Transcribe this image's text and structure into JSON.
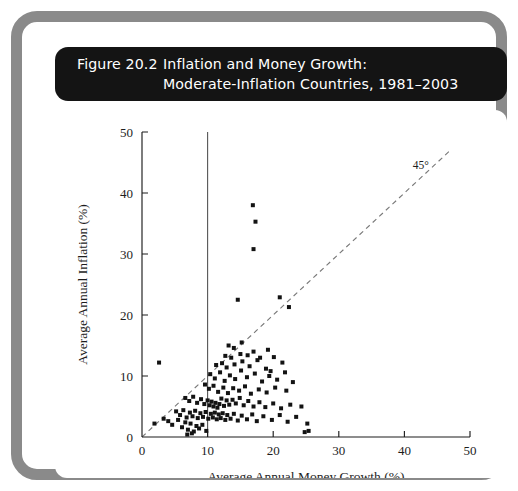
{
  "figure": {
    "number_label": "Figure 20.2",
    "title_line1": "Inflation and Money Growth:",
    "title_line2": "Moderate-Inflation Countries, 1981–2003",
    "frame_color": "#8a8a8a",
    "titlebar_color": "#141414",
    "panel_color": "#ffffff"
  },
  "chart_data": {
    "type": "scatter",
    "title": "Inflation and Money Growth: Moderate-Inflation Countries, 1981–2003",
    "xlabel": "Average Annual Money Growth (%)",
    "ylabel": "Average Annual Inflation (%)",
    "xlim": [
      0,
      50
    ],
    "ylim": [
      0,
      50
    ],
    "xticks": [
      0,
      10,
      20,
      30,
      40,
      50
    ],
    "yticks": [
      0,
      10,
      20,
      30,
      40,
      50
    ],
    "xticklabels": [
      "0",
      "10",
      "20",
      "30",
      "40",
      "50"
    ],
    "yticklabels": [
      "0",
      "10",
      "20",
      "30",
      "40",
      "50"
    ],
    "grid": false,
    "legend": null,
    "marker": "square",
    "marker_color": "#131313",
    "annotations": [
      {
        "text": "45°",
        "x": 42.5,
        "y": 44.0,
        "name": "forty-five-degree-label"
      }
    ],
    "reference_lines": [
      {
        "name": "forty-five-degree-line",
        "type": "diagonal",
        "from": [
          0,
          0
        ],
        "to": [
          47,
          47
        ],
        "style": "dashed",
        "color": "#7a7a7a"
      },
      {
        "name": "money-growth-10-percent-line",
        "type": "vertical",
        "x": 10,
        "y_from": 0,
        "y_to": 50,
        "style": "solid",
        "color": "#555555"
      }
    ],
    "series": [
      {
        "name": "Moderate-inflation countries",
        "points": [
          [
            2.6,
            12.2
          ],
          [
            16.9,
            38.0
          ],
          [
            17.3,
            35.3
          ],
          [
            17.0,
            30.8
          ],
          [
            14.6,
            22.5
          ],
          [
            21.0,
            22.9
          ],
          [
            22.4,
            21.3
          ],
          [
            13.2,
            15.0
          ],
          [
            14.0,
            14.6
          ],
          [
            15.2,
            15.5
          ],
          [
            12.7,
            13.3
          ],
          [
            13.6,
            13.0
          ],
          [
            15.0,
            13.6
          ],
          [
            16.1,
            13.4
          ],
          [
            17.0,
            14.0
          ],
          [
            18.0,
            13.0
          ],
          [
            19.2,
            14.3
          ],
          [
            11.3,
            11.8
          ],
          [
            12.2,
            12.1
          ],
          [
            12.9,
            11.4
          ],
          [
            14.1,
            11.9
          ],
          [
            15.3,
            12.4
          ],
          [
            16.4,
            11.6
          ],
          [
            17.6,
            12.6
          ],
          [
            18.9,
            11.2
          ],
          [
            20.1,
            13.1
          ],
          [
            21.4,
            12.2
          ],
          [
            19.6,
            10.8
          ],
          [
            10.4,
            10.3
          ],
          [
            11.1,
            9.6
          ],
          [
            11.9,
            10.6
          ],
          [
            12.6,
            9.2
          ],
          [
            13.4,
            10.1
          ],
          [
            14.2,
            9.5
          ],
          [
            15.1,
            10.9
          ],
          [
            16.0,
            9.8
          ],
          [
            17.2,
            10.4
          ],
          [
            18.3,
            9.1
          ],
          [
            19.4,
            10.0
          ],
          [
            20.6,
            9.4
          ],
          [
            21.8,
            10.6
          ],
          [
            23.0,
            9.0
          ],
          [
            9.6,
            8.6
          ],
          [
            10.2,
            7.9
          ],
          [
            10.9,
            8.4
          ],
          [
            11.6,
            7.4
          ],
          [
            12.4,
            8.1
          ],
          [
            13.1,
            7.2
          ],
          [
            13.9,
            8.0
          ],
          [
            14.8,
            7.6
          ],
          [
            15.7,
            8.3
          ],
          [
            16.6,
            7.1
          ],
          [
            17.8,
            7.8
          ],
          [
            19.0,
            7.3
          ],
          [
            20.3,
            8.1
          ],
          [
            22.0,
            7.6
          ],
          [
            6.6,
            6.4
          ],
          [
            7.2,
            5.9
          ],
          [
            7.8,
            6.6
          ],
          [
            8.4,
            5.6
          ],
          [
            9.0,
            6.2
          ],
          [
            9.5,
            5.4
          ],
          [
            10.0,
            6.0
          ],
          [
            10.3,
            5.2
          ],
          [
            10.6,
            5.8
          ],
          [
            10.9,
            5.0
          ],
          [
            11.2,
            5.6
          ],
          [
            11.5,
            4.8
          ],
          [
            11.8,
            5.4
          ],
          [
            12.1,
            6.3
          ],
          [
            12.5,
            5.1
          ],
          [
            12.9,
            6.0
          ],
          [
            13.3,
            5.3
          ],
          [
            13.8,
            6.1
          ],
          [
            14.3,
            5.5
          ],
          [
            14.9,
            6.4
          ],
          [
            15.5,
            5.2
          ],
          [
            16.2,
            5.9
          ],
          [
            17.0,
            5.0
          ],
          [
            17.9,
            5.7
          ],
          [
            18.8,
            4.9
          ],
          [
            20.0,
            5.5
          ],
          [
            21.2,
            4.7
          ],
          [
            22.6,
            5.3
          ],
          [
            24.3,
            5.0
          ],
          [
            5.2,
            4.2
          ],
          [
            5.8,
            3.6
          ],
          [
            6.3,
            4.4
          ],
          [
            6.8,
            3.2
          ],
          [
            7.3,
            4.0
          ],
          [
            7.7,
            3.4
          ],
          [
            8.1,
            4.3
          ],
          [
            8.5,
            3.1
          ],
          [
            8.9,
            3.9
          ],
          [
            9.3,
            3.3
          ],
          [
            9.7,
            4.1
          ],
          [
            10.1,
            3.0
          ],
          [
            10.5,
            3.8
          ],
          [
            10.8,
            3.2
          ],
          [
            11.1,
            4.0
          ],
          [
            11.4,
            2.9
          ],
          [
            11.7,
            3.7
          ],
          [
            12.0,
            3.1
          ],
          [
            12.3,
            3.9
          ],
          [
            12.7,
            2.8
          ],
          [
            13.0,
            3.6
          ],
          [
            13.5,
            3.0
          ],
          [
            14.0,
            3.8
          ],
          [
            14.6,
            2.7
          ],
          [
            15.2,
            3.5
          ],
          [
            16.0,
            2.9
          ],
          [
            16.8,
            3.7
          ],
          [
            17.5,
            2.6
          ],
          [
            18.5,
            3.4
          ],
          [
            19.8,
            2.8
          ],
          [
            21.0,
            3.6
          ],
          [
            22.2,
            2.5
          ],
          [
            23.5,
            3.3
          ],
          [
            25.2,
            2.2
          ],
          [
            4.0,
            2.6
          ],
          [
            4.6,
            2.0
          ],
          [
            5.5,
            2.8
          ],
          [
            6.1,
            1.6
          ],
          [
            6.6,
            2.4
          ],
          [
            7.0,
            1.2
          ],
          [
            7.4,
            2.2
          ],
          [
            7.9,
            0.9
          ],
          [
            8.3,
            1.8
          ],
          [
            8.7,
            1.4
          ],
          [
            9.2,
            2.0
          ],
          [
            9.8,
            1.0
          ],
          [
            6.9,
            0.4
          ],
          [
            7.6,
            0.6
          ],
          [
            1.9,
            2.2
          ],
          [
            3.3,
            3.0
          ],
          [
            24.8,
            0.8
          ],
          [
            25.4,
            1.0
          ]
        ]
      }
    ]
  }
}
